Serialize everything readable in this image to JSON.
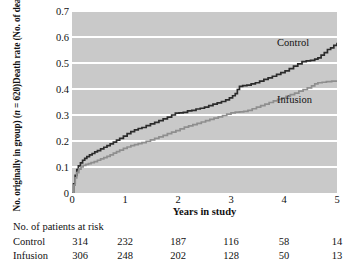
{
  "chart_data": {
    "type": "line",
    "title": "",
    "xlabel": "Years in study",
    "ylabel_line1": "Death rate (No. of deaths/",
    "ylabel_line2_pre": "No. originally in group) (",
    "ylabel_line2_ital": "n",
    "ylabel_line2_post": " = 620)",
    "xlim": [
      0,
      5
    ],
    "ylim": [
      0,
      0.7
    ],
    "xticks": [
      0,
      1,
      2,
      3,
      4,
      5
    ],
    "xtick_labels": [
      "0",
      "1",
      "2",
      "3",
      "4",
      "5"
    ],
    "yticks": [
      0,
      0.1,
      0.2,
      0.3,
      0.4,
      0.5,
      0.6,
      0.7
    ],
    "ytick_labels": [
      "0",
      "0.1",
      "0.2",
      "0.3",
      "0.4",
      "0.5",
      "0.6",
      "0.7"
    ],
    "grid": "horizontal-white-on-gray",
    "legend_position": "inline-right",
    "plot_background": "#c9c9c9",
    "gridline_color": "#ffffff",
    "series": [
      {
        "name": "Control",
        "color": "#2b2b2b",
        "label_x": 4.45,
        "label_y": 0.585,
        "points": [
          [
            0.0,
            0.0
          ],
          [
            0.03,
            0.035
          ],
          [
            0.06,
            0.068
          ],
          [
            0.09,
            0.09
          ],
          [
            0.12,
            0.104
          ],
          [
            0.16,
            0.116
          ],
          [
            0.2,
            0.126
          ],
          [
            0.24,
            0.133
          ],
          [
            0.28,
            0.14
          ],
          [
            0.33,
            0.147
          ],
          [
            0.38,
            0.152
          ],
          [
            0.43,
            0.158
          ],
          [
            0.48,
            0.163
          ],
          [
            0.54,
            0.17
          ],
          [
            0.6,
            0.176
          ],
          [
            0.66,
            0.182
          ],
          [
            0.72,
            0.189
          ],
          [
            0.78,
            0.196
          ],
          [
            0.84,
            0.203
          ],
          [
            0.9,
            0.21
          ],
          [
            0.97,
            0.219
          ],
          [
            1.04,
            0.228
          ],
          [
            1.11,
            0.236
          ],
          [
            1.18,
            0.243
          ],
          [
            1.25,
            0.248
          ],
          [
            1.32,
            0.252
          ],
          [
            1.4,
            0.259
          ],
          [
            1.48,
            0.266
          ],
          [
            1.56,
            0.272
          ],
          [
            1.64,
            0.278
          ],
          [
            1.72,
            0.285
          ],
          [
            1.8,
            0.292
          ],
          [
            1.88,
            0.3
          ],
          [
            1.95,
            0.307
          ],
          [
            2.02,
            0.308
          ],
          [
            2.1,
            0.31
          ],
          [
            2.18,
            0.316
          ],
          [
            2.26,
            0.318
          ],
          [
            2.34,
            0.323
          ],
          [
            2.42,
            0.326
          ],
          [
            2.5,
            0.33
          ],
          [
            2.58,
            0.336
          ],
          [
            2.66,
            0.342
          ],
          [
            2.74,
            0.347
          ],
          [
            2.82,
            0.352
          ],
          [
            2.9,
            0.358
          ],
          [
            2.97,
            0.366
          ],
          [
            3.03,
            0.374
          ],
          [
            3.08,
            0.382
          ],
          [
            3.12,
            0.398
          ],
          [
            3.16,
            0.41
          ],
          [
            3.22,
            0.413
          ],
          [
            3.3,
            0.415
          ],
          [
            3.38,
            0.42
          ],
          [
            3.46,
            0.424
          ],
          [
            3.54,
            0.43
          ],
          [
            3.62,
            0.437
          ],
          [
            3.7,
            0.443
          ],
          [
            3.78,
            0.449
          ],
          [
            3.86,
            0.456
          ],
          [
            3.94,
            0.463
          ],
          [
            4.02,
            0.47
          ],
          [
            4.1,
            0.478
          ],
          [
            4.18,
            0.488
          ],
          [
            4.26,
            0.497
          ],
          [
            4.34,
            0.505
          ],
          [
            4.42,
            0.508
          ],
          [
            4.5,
            0.51
          ],
          [
            4.58,
            0.515
          ],
          [
            4.64,
            0.52
          ],
          [
            4.7,
            0.53
          ],
          [
            4.76,
            0.54
          ],
          [
            4.82,
            0.552
          ],
          [
            4.88,
            0.558
          ],
          [
            4.94,
            0.568
          ],
          [
            5.0,
            0.578
          ]
        ]
      },
      {
        "name": "Infusion",
        "color": "#8e8e8e",
        "label_x": 4.45,
        "label_y": 0.365,
        "points": [
          [
            0.0,
            0.0
          ],
          [
            0.03,
            0.03
          ],
          [
            0.06,
            0.058
          ],
          [
            0.09,
            0.078
          ],
          [
            0.13,
            0.092
          ],
          [
            0.17,
            0.1
          ],
          [
            0.21,
            0.106
          ],
          [
            0.26,
            0.11
          ],
          [
            0.31,
            0.113
          ],
          [
            0.36,
            0.117
          ],
          [
            0.42,
            0.121
          ],
          [
            0.48,
            0.126
          ],
          [
            0.54,
            0.131
          ],
          [
            0.6,
            0.136
          ],
          [
            0.66,
            0.141
          ],
          [
            0.72,
            0.147
          ],
          [
            0.78,
            0.153
          ],
          [
            0.84,
            0.159
          ],
          [
            0.9,
            0.165
          ],
          [
            0.97,
            0.172
          ],
          [
            1.04,
            0.177
          ],
          [
            1.11,
            0.182
          ],
          [
            1.18,
            0.186
          ],
          [
            1.25,
            0.19
          ],
          [
            1.32,
            0.194
          ],
          [
            1.4,
            0.199
          ],
          [
            1.48,
            0.204
          ],
          [
            1.56,
            0.21
          ],
          [
            1.64,
            0.216
          ],
          [
            1.72,
            0.222
          ],
          [
            1.8,
            0.228
          ],
          [
            1.88,
            0.234
          ],
          [
            1.96,
            0.24
          ],
          [
            2.04,
            0.247
          ],
          [
            2.12,
            0.253
          ],
          [
            2.2,
            0.258
          ],
          [
            2.28,
            0.263
          ],
          [
            2.36,
            0.268
          ],
          [
            2.44,
            0.273
          ],
          [
            2.52,
            0.278
          ],
          [
            2.6,
            0.283
          ],
          [
            2.68,
            0.288
          ],
          [
            2.76,
            0.293
          ],
          [
            2.84,
            0.298
          ],
          [
            2.92,
            0.303
          ],
          [
            3.0,
            0.308
          ],
          [
            3.08,
            0.311
          ],
          [
            3.16,
            0.312
          ],
          [
            3.24,
            0.314
          ],
          [
            3.32,
            0.318
          ],
          [
            3.4,
            0.324
          ],
          [
            3.48,
            0.33
          ],
          [
            3.56,
            0.336
          ],
          [
            3.64,
            0.342
          ],
          [
            3.72,
            0.348
          ],
          [
            3.8,
            0.354
          ],
          [
            3.88,
            0.36
          ],
          [
            3.96,
            0.366
          ],
          [
            4.04,
            0.372
          ],
          [
            4.12,
            0.378
          ],
          [
            4.2,
            0.384
          ],
          [
            4.28,
            0.392
          ],
          [
            4.36,
            0.398
          ],
          [
            4.44,
            0.404
          ],
          [
            4.52,
            0.412
          ],
          [
            4.58,
            0.42
          ],
          [
            4.64,
            0.424
          ],
          [
            4.72,
            0.426
          ],
          [
            4.8,
            0.428
          ],
          [
            4.9,
            0.43
          ],
          [
            5.0,
            0.431
          ]
        ]
      }
    ]
  },
  "risk_table": {
    "caption": "No. of patients at risk",
    "columns": [
      0,
      1,
      2,
      3,
      4,
      5
    ],
    "rows": [
      {
        "label": "Control",
        "values": [
          "314",
          "232",
          "187",
          "116",
          "58",
          "14"
        ]
      },
      {
        "label": "Infusion",
        "values": [
          "306",
          "248",
          "202",
          "128",
          "50",
          "13"
        ]
      }
    ]
  }
}
